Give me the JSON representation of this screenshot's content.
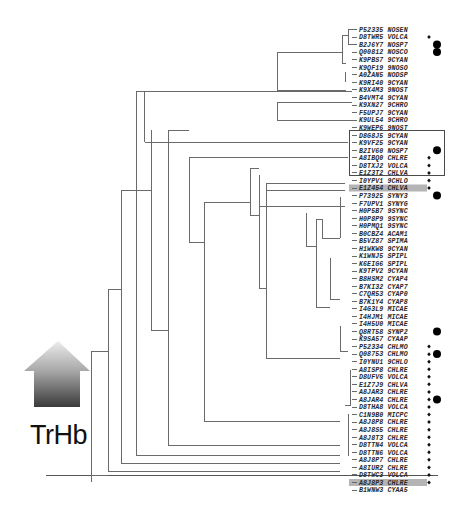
{
  "figure": {
    "title_label": "TrHb",
    "arrow_gradient": {
      "top": "#e8e8e8",
      "bottom": "#3a3a3a"
    },
    "highlight_color": "#b4b4b4",
    "line_color": "#6a6a6a"
  },
  "legend_markers": {
    "diamond": "small diamond marker",
    "dot": "large filled circle marker"
  },
  "leaves": [
    {
      "id": "P52335",
      "org": "NOSEN",
      "diamond": false,
      "dot": false
    },
    {
      "id": "D8TWR5",
      "org": "VOLCA",
      "diamond": true,
      "dot": false
    },
    {
      "id": "B2J6Y7",
      "org": "NOSP7",
      "diamond": false,
      "dot": true
    },
    {
      "id": "Q00812",
      "org": "NOSCO",
      "diamond": false,
      "dot": true
    },
    {
      "id": "K9PBS7",
      "org": "9CYAN",
      "diamond": false,
      "dot": false
    },
    {
      "id": "K9QF19",
      "org": "9NOSO",
      "diamond": false,
      "dot": false
    },
    {
      "id": "A0ZAN5",
      "org": "NODSP",
      "diamond": false,
      "dot": false
    },
    {
      "id": "K9RI40",
      "org": "9CYAN",
      "diamond": false,
      "dot": false
    },
    {
      "id": "K9X4M3",
      "org": "9NOST",
      "diamond": false,
      "dot": false
    },
    {
      "id": "B4VMT4",
      "org": "9CYAN",
      "diamond": false,
      "dot": false
    },
    {
      "id": "K9XN27",
      "org": "9CHRO",
      "diamond": false,
      "dot": false
    },
    {
      "id": "F5UPJ7",
      "org": "9CYAN",
      "diamond": false,
      "dot": false
    },
    {
      "id": "K9UL54",
      "org": "9CHRO",
      "diamond": false,
      "dot": false,
      "boxed": true
    },
    {
      "id": "K9WEP6",
      "org": "9NOST",
      "diamond": false,
      "dot": false,
      "boxed": true
    },
    {
      "id": "D8G8J5",
      "org": "9CYAN",
      "diamond": false,
      "dot": false,
      "boxed": true
    },
    {
      "id": "K9VF25",
      "org": "9CYAN",
      "diamond": false,
      "dot": false,
      "boxed": true
    },
    {
      "id": "B2IV60",
      "org": "NOSP7",
      "diamond": false,
      "dot": true,
      "boxed": true
    },
    {
      "id": "A8IBQ0",
      "org": "CHLRE",
      "diamond": true,
      "dot": false
    },
    {
      "id": "D8TXJ2",
      "org": "VOLCA",
      "diamond": true,
      "dot": false
    },
    {
      "id": "E1Z3T2",
      "org": "CHLVA",
      "diamond": true,
      "dot": false
    },
    {
      "id": "I0YPV1",
      "org": "9CHLO",
      "diamond": true,
      "dot": false
    },
    {
      "id": "E1Z454",
      "org": "CHLVA",
      "diamond": true,
      "dot": false,
      "highlight": true
    },
    {
      "id": "P73925",
      "org": "SYNY3",
      "diamond": false,
      "dot": true
    },
    {
      "id": "F7UPV1",
      "org": "SYNYG",
      "diamond": false,
      "dot": false
    },
    {
      "id": "H0P5B7",
      "org": "9SYNC",
      "diamond": false,
      "dot": false
    },
    {
      "id": "H0P8P9",
      "org": "9SYNC",
      "diamond": false,
      "dot": false
    },
    {
      "id": "H0PMQ1",
      "org": "9SYNC",
      "diamond": false,
      "dot": false
    },
    {
      "id": "B0CBZ4",
      "org": "ACAM1",
      "diamond": false,
      "dot": false
    },
    {
      "id": "B5VZ87",
      "org": "SPIMA",
      "diamond": false,
      "dot": false
    },
    {
      "id": "H1WKW8",
      "org": "9CYAN",
      "diamond": false,
      "dot": false
    },
    {
      "id": "K1WNJ5",
      "org": "SPIPL",
      "diamond": false,
      "dot": false
    },
    {
      "id": "K6EIG6",
      "org": "SPIPL",
      "diamond": false,
      "dot": false
    },
    {
      "id": "K9TPV2",
      "org": "9CYAN",
      "diamond": false,
      "dot": false
    },
    {
      "id": "B8HSM2",
      "org": "CYAP4",
      "diamond": false,
      "dot": false
    },
    {
      "id": "B7KI32",
      "org": "CYAP7",
      "diamond": false,
      "dot": false
    },
    {
      "id": "C7QR53",
      "org": "CYAP0",
      "diamond": false,
      "dot": false
    },
    {
      "id": "B7K1Y4",
      "org": "CYAP8",
      "diamond": false,
      "dot": false
    },
    {
      "id": "I4G3L9",
      "org": "MICAE",
      "diamond": false,
      "dot": false
    },
    {
      "id": "I4HJM1",
      "org": "MICAE",
      "diamond": false,
      "dot": false
    },
    {
      "id": "I4H5U0",
      "org": "MICAE",
      "diamond": false,
      "dot": false
    },
    {
      "id": "Q8RT58",
      "org": "SYNP2",
      "diamond": false,
      "dot": true
    },
    {
      "id": "K9SA57",
      "org": "CYAAP",
      "diamond": false,
      "dot": false
    },
    {
      "id": "P52334",
      "org": "CHLMO",
      "diamond": true,
      "dot": false
    },
    {
      "id": "Q08753",
      "org": "CHLMO",
      "diamond": true,
      "dot": true
    },
    {
      "id": "I0YNU1",
      "org": "9CHLO",
      "diamond": true,
      "dot": false
    },
    {
      "id": "A8ISP8",
      "org": "CHLRE",
      "diamond": true,
      "dot": false
    },
    {
      "id": "D8UFV6",
      "org": "VOLCA",
      "diamond": true,
      "dot": false
    },
    {
      "id": "E1Z7J9",
      "org": "CHLVA",
      "diamond": true,
      "dot": false
    },
    {
      "id": "A8JAR3",
      "org": "CHLRE",
      "diamond": true,
      "dot": false
    },
    {
      "id": "A8JAR4",
      "org": "CHLRE",
      "diamond": true,
      "dot": true
    },
    {
      "id": "D8THA8",
      "org": "VOLCA",
      "diamond": true,
      "dot": false
    },
    {
      "id": "C1N9B0",
      "org": "MICPC",
      "diamond": true,
      "dot": false
    },
    {
      "id": "A8J8P8",
      "org": "CHLRE",
      "diamond": true,
      "dot": false
    },
    {
      "id": "A8J8S5",
      "org": "CHLRE",
      "diamond": true,
      "dot": false
    },
    {
      "id": "A8J8T3",
      "org": "CHLRE",
      "diamond": true,
      "dot": false
    },
    {
      "id": "D8TTN4",
      "org": "VOLCA",
      "diamond": true,
      "dot": false
    },
    {
      "id": "D8TTN6",
      "org": "VOLCA",
      "diamond": true,
      "dot": false
    },
    {
      "id": "A8J8P7",
      "org": "CHLRE",
      "diamond": true,
      "dot": false
    },
    {
      "id": "A8IUR2",
      "org": "CHLRE",
      "diamond": true,
      "dot": false
    },
    {
      "id": "D8TWC3",
      "org": "VOLCA",
      "diamond": true,
      "dot": false
    },
    {
      "id": "A8J8P3",
      "org": "CHLRE",
      "diamond": true,
      "dot": false,
      "highlight": true
    },
    {
      "id": "B1WNW3",
      "org": "CYAA5",
      "diamond": false,
      "dot": false
    }
  ]
}
